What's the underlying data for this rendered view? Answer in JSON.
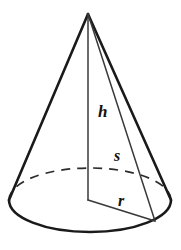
{
  "figure": {
    "name": "cone-geometry-diagram",
    "shape": "cone",
    "background_color": "#ffffff",
    "stroke_color": "#1a1a1a",
    "thin_stroke_color": "#3a3a3a",
    "dashed_stroke_color": "#2b2b2b",
    "labels": [
      {
        "id": "height",
        "text": "h",
        "meaning": "height",
        "x": 98,
        "y": 117,
        "font_size": 17
      },
      {
        "id": "slant",
        "text": "s",
        "meaning": "slant-height",
        "x": 114,
        "y": 161,
        "font_size": 16
      },
      {
        "id": "radius",
        "text": "r",
        "meaning": "radius",
        "x": 118,
        "y": 206,
        "font_size": 16
      }
    ],
    "geometry": {
      "apex": {
        "x": 88,
        "y": 14
      },
      "base_center": {
        "x": 90,
        "y": 200
      },
      "base_rx": 81,
      "base_ry": 32,
      "left_slant_end": {
        "x": 9,
        "y": 200
      },
      "right_slant_end": {
        "x": 171,
        "y": 200
      },
      "radius_end": {
        "x": 155,
        "y": 221
      },
      "height_foot": {
        "x": 88,
        "y": 200
      }
    }
  }
}
